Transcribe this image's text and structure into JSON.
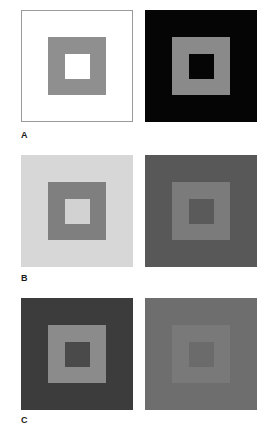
{
  "figure": {
    "background": "#ffffff",
    "width": 273,
    "height": 430
  },
  "chart_data": {
    "type": "table",
    "title": "",
    "columns": [
      "row",
      "panel",
      "surround_hex",
      "annulus_hex",
      "center_hex"
    ],
    "rows": [
      [
        "A",
        "left",
        "#ffffff",
        "#8f8f8f",
        "#ffffff"
      ],
      [
        "A",
        "right",
        "#050505",
        "#8a8a8a",
        "#050505"
      ],
      [
        "B",
        "left",
        "#d7d7d7",
        "#7f7f7f",
        "#d2d2d2"
      ],
      [
        "B",
        "right",
        "#585858",
        "#7b7b7b",
        "#5a5a5a"
      ],
      [
        "C",
        "left",
        "#3c3c3c",
        "#8b8b8b",
        "#4a4a4a"
      ],
      [
        "C",
        "right",
        "#6e6e6e",
        "#797979",
        "#6b6b6b"
      ]
    ],
    "legend_position": "none",
    "grid": false
  },
  "rows": [
    {
      "label": "A",
      "left": {
        "name": "white-surround-stimulus",
        "surround": "#ffffff",
        "border": "#9a9a9a",
        "annulus": "#8f8f8f",
        "center": "#ffffff"
      },
      "right": {
        "name": "black-surround-stimulus",
        "surround": "#050505",
        "border": "#050505",
        "annulus": "#8a8a8a",
        "center": "#050505"
      }
    },
    {
      "label": "B",
      "left": {
        "name": "light-gray-surround-stimulus",
        "surround": "#d7d7d7",
        "border": "#d7d7d7",
        "annulus": "#7f7f7f",
        "center": "#d2d2d2"
      },
      "right": {
        "name": "dark-gray-surround-stimulus",
        "surround": "#585858",
        "border": "#585858",
        "annulus": "#7b7b7b",
        "center": "#5a5a5a"
      }
    },
    {
      "label": "C",
      "left": {
        "name": "high-contrast-stimulus",
        "surround": "#3c3c3c",
        "border": "#3c3c3c",
        "annulus": "#8b8b8b",
        "center": "#4a4a4a"
      },
      "right": {
        "name": "low-contrast-stimulus",
        "surround": "#6e6e6e",
        "border": "#6e6e6e",
        "annulus": "#797979",
        "center": "#6b6b6b"
      }
    }
  ]
}
